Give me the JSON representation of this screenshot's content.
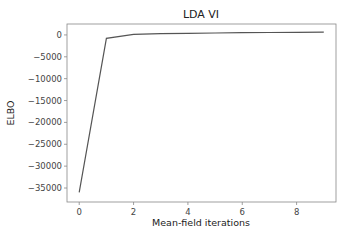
{
  "chart_data": {
    "type": "line",
    "title": "LDA VI",
    "xlabel": "Mean-field iterations",
    "ylabel": "ELBO",
    "x": [
      0,
      1,
      2,
      3,
      4,
      5,
      6,
      7,
      8,
      9
    ],
    "series": [
      {
        "name": "ELBO",
        "values": [
          -36000,
          -800,
          150,
          300,
          380,
          440,
          500,
          550,
          600,
          650
        ],
        "color": "#555555"
      }
    ],
    "xticks": [
      0,
      2,
      4,
      6,
      8
    ],
    "yticks": [
      0,
      -5000,
      -10000,
      -15000,
      -20000,
      -25000,
      -30000,
      -35000
    ],
    "xlim": [
      -0.45,
      9.45
    ],
    "ylim": [
      -38200,
      2500
    ],
    "grid": false,
    "legend": null
  }
}
